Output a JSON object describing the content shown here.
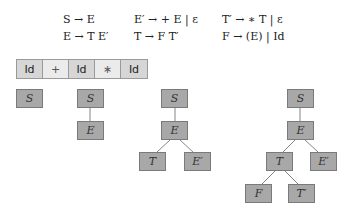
{
  "grammar": {
    "rules": [
      {
        "id": "r1",
        "text": "S → E"
      },
      {
        "id": "r2",
        "text": "E′ → + E | ε"
      },
      {
        "id": "r3",
        "text": "T′ → ∗ T | ε"
      },
      {
        "id": "r4",
        "text": "E → T E′"
      },
      {
        "id": "r5",
        "text": "T → F T′"
      },
      {
        "id": "r6",
        "text": "F → (E) | Id"
      }
    ]
  },
  "tokens": [
    "Id",
    "+",
    "Id",
    "∗",
    "Id"
  ],
  "trees": [
    {
      "step": 1,
      "nodes": [
        {
          "label": "S"
        }
      ]
    },
    {
      "step": 2,
      "nodes": [
        {
          "label": "S"
        },
        {
          "label": "E"
        }
      ]
    },
    {
      "step": 3,
      "nodes": [
        {
          "label": "S"
        },
        {
          "label": "E"
        },
        {
          "label": "T"
        },
        {
          "label": "E′"
        }
      ]
    },
    {
      "step": 4,
      "nodes": [
        {
          "label": "S"
        },
        {
          "label": "E"
        },
        {
          "label": "T"
        },
        {
          "label": "E′"
        },
        {
          "label": "F"
        },
        {
          "label": "T′"
        }
      ]
    }
  ],
  "colors": {
    "node_fill": "#a8a8a8",
    "token_id_fill": "#d6d6d6",
    "token_op_fill": "#ebebeb",
    "edge": "#666666"
  }
}
